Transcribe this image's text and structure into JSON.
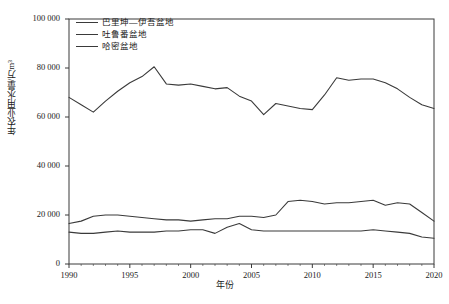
{
  "chart_data": {
    "type": "line",
    "title": "",
    "xlabel": "年份",
    "ylabel": "年农业用水量/万m³",
    "xlim": [
      1990,
      2020
    ],
    "ylim": [
      0,
      100000
    ],
    "grid": false,
    "legend_position": "top-left",
    "x_ticks": [
      "1990",
      "1995",
      "2000",
      "2005",
      "2010",
      "2015",
      "2020"
    ],
    "y_ticks": [
      "0",
      "20 000",
      "40 000",
      "60 000",
      "80 000",
      "100 000"
    ],
    "x": [
      1990,
      1991,
      1992,
      1993,
      1994,
      1995,
      1996,
      1997,
      1998,
      1999,
      2000,
      2001,
      2002,
      2003,
      2004,
      2005,
      2006,
      2007,
      2008,
      2009,
      2010,
      2011,
      2012,
      2013,
      2014,
      2015,
      2016,
      2017,
      2018,
      2019,
      2020
    ],
    "series": [
      {
        "name": "巴里坤—伊吾盆地",
        "color": "#3a3a3a",
        "values": [
          68000,
          65000,
          62000,
          66500,
          70500,
          74000,
          76500,
          80500,
          73500,
          73000,
          73500,
          72500,
          71500,
          72000,
          68500,
          66500,
          61000,
          65500,
          64500,
          63500,
          63000,
          69000,
          76000,
          75000,
          75500,
          75500,
          74000,
          71500,
          68000,
          65000,
          63500
        ]
      },
      {
        "name": "吐鲁番盆地",
        "color": "#3a3a3a",
        "values": [
          16500,
          17500,
          19500,
          20000,
          20000,
          19500,
          19000,
          18500,
          18000,
          18000,
          17500,
          18000,
          18500,
          18500,
          19500,
          19500,
          19000,
          20000,
          25500,
          26000,
          25500,
          24500,
          25000,
          25000,
          25500,
          26000,
          24000,
          25000,
          24500,
          21000,
          17500
        ]
      },
      {
        "name": "哈密盆地",
        "color": "#3a3a3a",
        "values": [
          13000,
          12500,
          12500,
          13000,
          13500,
          13000,
          13000,
          13000,
          13500,
          13500,
          14000,
          14000,
          12500,
          15000,
          16500,
          14000,
          13500,
          13500,
          13500,
          13500,
          13500,
          13500,
          13500,
          13500,
          13500,
          14000,
          13500,
          13000,
          12500,
          11000,
          10500
        ]
      }
    ]
  },
  "legend": {
    "items": [
      {
        "label": "巴里坤—伊吾盆地"
      },
      {
        "label": "吐鲁番盆地"
      },
      {
        "label": "哈密盆地"
      }
    ]
  },
  "caption": {
    "text": ""
  }
}
